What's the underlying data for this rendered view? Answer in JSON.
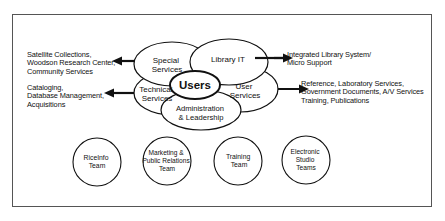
{
  "diagram": {
    "center": {
      "label": "Users"
    },
    "units": [
      {
        "id": "special",
        "lines": [
          "Special",
          "Services"
        ]
      },
      {
        "id": "library-it",
        "lines": [
          "Library IT"
        ]
      },
      {
        "id": "technical",
        "lines": [
          "Technical",
          "Services"
        ]
      },
      {
        "id": "user",
        "lines": [
          "User",
          "Services"
        ]
      },
      {
        "id": "admin",
        "lines": [
          "Administration",
          "& Leadership"
        ]
      }
    ],
    "descriptions": {
      "special": [
        "Satellite Collections,",
        "Woodson Research Center,",
        "Community Services"
      ],
      "technical": [
        "Cataloging,",
        "Database Management,",
        "Acquisitions"
      ],
      "library_it": [
        "Integrated Library System/",
        "Micro Support"
      ],
      "user": [
        "Reference, Laboratory Services,",
        "Government Documents, A/V Services",
        "Training, Publications"
      ]
    },
    "teams": [
      {
        "id": "riceinfo",
        "lines": [
          "RiceInfo",
          "Team"
        ]
      },
      {
        "id": "marketing",
        "lines": [
          "Marketing &",
          "Public Relations",
          "Team"
        ]
      },
      {
        "id": "training",
        "lines": [
          "Training",
          "Team"
        ]
      },
      {
        "id": "electronic",
        "lines": [
          "Electronic",
          "Studio",
          "Teams"
        ]
      }
    ]
  }
}
